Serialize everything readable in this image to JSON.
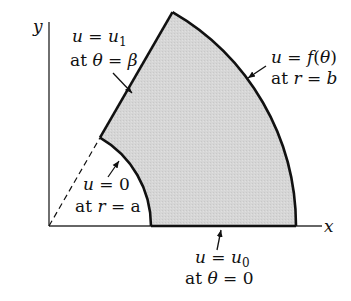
{
  "diagram": {
    "axes": {
      "x_label": "x",
      "y_label": "y"
    },
    "geometry": {
      "origin": [
        49,
        226
      ],
      "inner_radius_label": "a",
      "outer_radius_label": "b",
      "angle_label": "β",
      "angle_deg": 60,
      "inner_radius_px": 102,
      "outer_radius_px": 247,
      "fill_color": "#d4d4d4",
      "stroke_color": "#111111"
    },
    "labels": {
      "top_edge": {
        "line1": "u = u₁",
        "line2": "at θ = β"
      },
      "outer_arc": {
        "line1": "u = f(θ)",
        "line2": "at r = b"
      },
      "inner_arc": {
        "line1": "u = 0",
        "line2": "at r = a"
      },
      "bottom_edge": {
        "line1": "u = u₀",
        "line2": "at θ = 0"
      }
    }
  }
}
